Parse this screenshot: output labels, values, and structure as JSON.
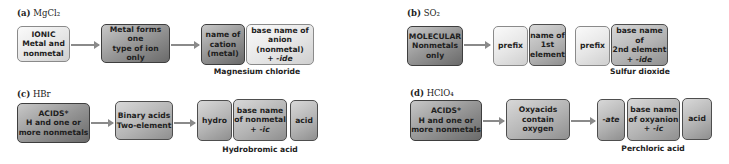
{
  "panels": {
    "a": {
      "label_letter": "(a)",
      "label_formula": "MgCl₂",
      "box1": [
        "IONIC",
        "Metal and",
        "nonmetal"
      ],
      "box2": [
        "Metal forms one",
        "type of ion only"
      ],
      "box3": [
        "name of",
        "cation",
        "(metal)"
      ],
      "box4": [
        "base name of",
        "anion (nonmetal)",
        "+ ",
        "-ide"
      ],
      "caption": "Magnesium chloride"
    },
    "b": {
      "label_letter": "(b)",
      "label_formula": "SO₂",
      "box1": [
        "MOLECULAR",
        "Nonmetals",
        "only"
      ],
      "box2": "prefix",
      "box3": [
        "name of",
        "1st",
        "element"
      ],
      "box4": "prefix",
      "box5": [
        "base name of",
        "2nd element",
        "+ ",
        "-ide"
      ],
      "caption": "Sulfur dioxide"
    },
    "c": {
      "label_letter": "(c)",
      "label_formula": "HBr",
      "box1": [
        "ACIDS*",
        "H and one or",
        "more nonmetals"
      ],
      "box2": [
        "Binary acids",
        "Two-element"
      ],
      "box3": "hydro",
      "box4": [
        "base name",
        "of nonmetal",
        "+ ",
        "-ic"
      ],
      "box5": "acid",
      "caption": "Hydrobromic acid"
    },
    "d": {
      "label_letter": "(d)",
      "label_formula": "HClO₄",
      "box1": [
        "ACIDS*",
        "H and one or",
        "more nonmetals"
      ],
      "box2": [
        "Oxyacids",
        "contain oxygen"
      ],
      "box3": "-ate",
      "box4": [
        "base name",
        "of oxyanion",
        "+ ",
        "-ic"
      ],
      "box5": "acid",
      "caption": "Perchloric acid"
    }
  }
}
